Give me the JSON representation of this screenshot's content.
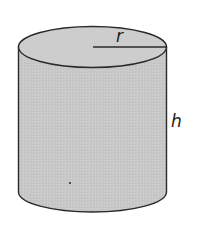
{
  "diagram": {
    "shape": "cylinder",
    "labels": {
      "radius": "r",
      "height": "h"
    },
    "colors": {
      "fill": "#c9c9c9",
      "top_fill": "#cdcdcd",
      "stroke": "#2a2a2a",
      "background": "#ffffff"
    }
  }
}
